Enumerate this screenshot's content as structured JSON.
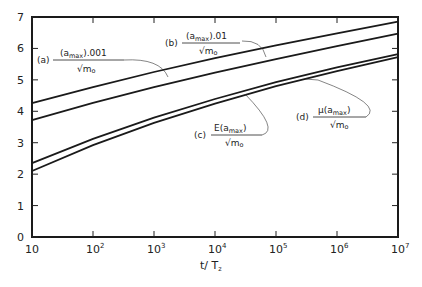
{
  "chart_data": {
    "type": "line",
    "title": "",
    "xlabel": "t/T_z",
    "ylabel": "",
    "xscale": "log",
    "xlim": [
      10,
      10000000
    ],
    "ylim": [
      0,
      7
    ],
    "grid": false,
    "legend_position": "inline annotations",
    "x_tick_labels": [
      "10",
      "10^2",
      "10^3",
      "10^4",
      "10^5",
      "10^6",
      "10^7"
    ],
    "y_tick_labels": [
      "0",
      "1",
      "2",
      "3",
      "4",
      "5",
      "6",
      "7"
    ],
    "x": [
      10,
      100,
      1000,
      10000,
      100000,
      1000000,
      10000000
    ],
    "series": [
      {
        "name": "(a) (a_max).001 / sqrt(m_0)",
        "values": [
          4.26,
          4.77,
          5.25,
          5.69,
          6.1,
          6.48,
          6.85
        ]
      },
      {
        "name": "(b) (a_max).01 / sqrt(m_0)",
        "values": [
          3.72,
          4.27,
          4.77,
          5.23,
          5.66,
          6.07,
          6.47
        ]
      },
      {
        "name": "(c) E(a_max) / sqrt(m_0)",
        "values": [
          2.35,
          3.12,
          3.8,
          4.39,
          4.93,
          5.4,
          5.82
        ]
      },
      {
        "name": "(d) mu(a_max) / sqrt(m_0)",
        "values": [
          2.1,
          2.92,
          3.63,
          4.24,
          4.8,
          5.28,
          5.72
        ]
      }
    ],
    "annotations": [
      {
        "label": "(a)",
        "numerator": "(a_max).001",
        "denominator": "sqrt(m_o)"
      },
      {
        "label": "(b)",
        "numerator": "(a_max).01",
        "denominator": "sqrt(m_o)"
      },
      {
        "label": "(c)",
        "numerator": "E(a_max)",
        "denominator": "sqrt(m_o)"
      },
      {
        "label": "(d)",
        "numerator": "mu(a_max)",
        "denominator": "sqrt(m_o)"
      }
    ]
  },
  "axis": {
    "y_ticks": [
      "0",
      "1",
      "2",
      "3",
      "4",
      "5",
      "6",
      "7"
    ],
    "x_ticks": [
      {
        "base": "10",
        "exp": ""
      },
      {
        "base": "10",
        "exp": "2"
      },
      {
        "base": "10",
        "exp": "3"
      },
      {
        "base": "10",
        "exp": "4"
      },
      {
        "base": "10",
        "exp": "5"
      },
      {
        "base": "10",
        "exp": "6"
      },
      {
        "base": "10",
        "exp": "7"
      }
    ],
    "xlabel_main": "t/ T",
    "xlabel_sub": "z"
  },
  "labels": {
    "a": {
      "tag": "(a)",
      "num_pre": "(a",
      "num_sub": "max",
      "num_post": ").001",
      "den": "√m",
      "den_sub": "o"
    },
    "b": {
      "tag": "(b)",
      "num_pre": "(a",
      "num_sub": "max",
      "num_post": ").01",
      "den": "√m",
      "den_sub": "o"
    },
    "c": {
      "tag": "(c)",
      "num_pre": "E(a",
      "num_sub": "max",
      "num_post": ")",
      "den": "√m",
      "den_sub": "o"
    },
    "d": {
      "tag": "(d)",
      "num_pre": "μ(a",
      "num_sub": "max",
      "num_post": ")",
      "den": "√m",
      "den_sub": "o"
    }
  }
}
